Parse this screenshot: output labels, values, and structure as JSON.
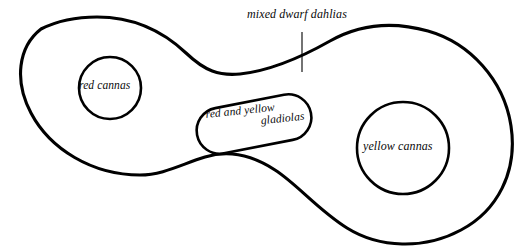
{
  "diagram": {
    "background_color": "#ffffff",
    "line_color": "#000000",
    "plots": [
      {
        "id": "red-cannas",
        "label": "red cannas",
        "shape": "circle",
        "center": [
          110,
          88
        ],
        "radius": 31
      },
      {
        "id": "red-and-yellow-gladiolas",
        "label_line_1": "red and yellow",
        "label_line_2": "gladiolas",
        "shape": "stadium",
        "center": [
          254,
          124
        ],
        "rotation_degrees": -11
      },
      {
        "id": "yellow-cannas",
        "label": "yellow cannas",
        "shape": "circle",
        "center": [
          403,
          148
        ],
        "radius": 46
      }
    ],
    "callout": {
      "id": "mixed-dwarf-dahlias",
      "label": "mixed dwarf dahlias",
      "leader_line": {
        "x": 302,
        "y_top": 32,
        "y_bottom": 72
      }
    }
  }
}
